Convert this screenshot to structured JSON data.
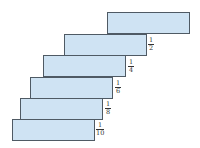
{
  "diagram": {
    "colors": {
      "fill": "#cfe3f3",
      "border": "#4f5a64",
      "text": "#333333"
    },
    "blocks": [
      {
        "index": 1,
        "left": 107,
        "top": 12
      },
      {
        "index": 2,
        "left": 64,
        "top": 34
      },
      {
        "index": 3,
        "left": 43,
        "top": 55
      },
      {
        "index": 4,
        "left": 30,
        "top": 77
      },
      {
        "index": 5,
        "left": 20,
        "top": 98
      },
      {
        "index": 6,
        "left": 12,
        "top": 119
      }
    ],
    "labels": [
      {
        "numerator": "1",
        "denominator": "2",
        "left": 148,
        "top": 37
      },
      {
        "numerator": "1",
        "denominator": "4",
        "left": 128,
        "top": 59
      },
      {
        "numerator": "1",
        "denominator": "6",
        "left": 115,
        "top": 80
      },
      {
        "numerator": "1",
        "denominator": "8",
        "left": 105,
        "top": 101
      },
      {
        "numerator": "1",
        "denominator": "10",
        "left": 96,
        "top": 122
      }
    ]
  }
}
